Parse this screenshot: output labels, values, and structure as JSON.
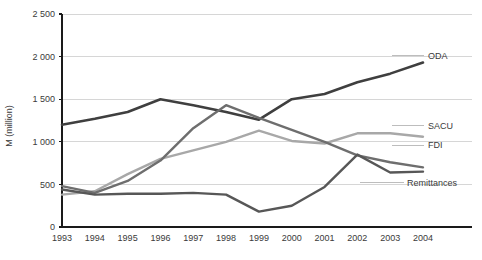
{
  "chart_data": {
    "type": "line",
    "title": "",
    "xlabel": "",
    "ylabel": "M (million)",
    "x": [
      1993,
      1994,
      1995,
      1996,
      1997,
      1998,
      1999,
      2000,
      2001,
      2002,
      2003,
      2004
    ],
    "xtick_labels": [
      "1993",
      "1994",
      "1995",
      "1996",
      "1997",
      "1998",
      "1999",
      "2000",
      "2001",
      "2002",
      "2003",
      "2004"
    ],
    "ylim": [
      0,
      2500
    ],
    "ytick_values": [
      0,
      500,
      1000,
      1500,
      2000,
      2500
    ],
    "ytick_labels": [
      "0",
      "500",
      "1 000",
      "1 500",
      "2 000",
      "2 500"
    ],
    "grid": true,
    "grid_axis": "y",
    "legend_position": "right-inline-labels",
    "series": [
      {
        "name": "ODA",
        "color": "#3f3f3f",
        "width": 2.6,
        "values": [
          1200,
          1270,
          1350,
          1500,
          1430,
          1350,
          1260,
          1500,
          1560,
          1700,
          1800,
          1930
        ],
        "label_value": 2010
      },
      {
        "name": "SACU",
        "color": "#a8a8a8",
        "width": 2.4,
        "values": [
          380,
          420,
          620,
          800,
          900,
          1000,
          1130,
          1010,
          980,
          1100,
          1100,
          1060
        ],
        "label_value": 1190
      },
      {
        "name": "FDI",
        "color": "#6e6e6e",
        "width": 2.4,
        "values": [
          480,
          400,
          540,
          780,
          1160,
          1430,
          1280,
          1140,
          1000,
          840,
          760,
          700
        ],
        "label_value": 960
      },
      {
        "name": "Remittances",
        "color": "#575757",
        "width": 2.4,
        "values": [
          440,
          380,
          390,
          390,
          400,
          380,
          180,
          250,
          470,
          850,
          640,
          650
        ],
        "label_value": 520
      }
    ]
  },
  "axes": {
    "axis_color": "#1a1a1a",
    "grid_color": "#d6d6d6",
    "tick_color": "#1a1a1a"
  }
}
